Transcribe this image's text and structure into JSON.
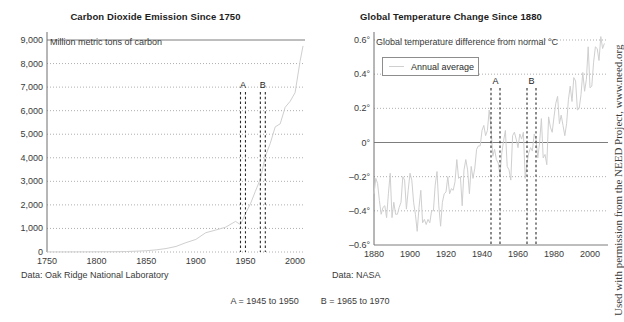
{
  "figure": {
    "side_note": "Used with permission from the NEED Project, www.need.org",
    "band_caption_a": "A  =  1945 to 1950",
    "band_caption_b": "B  =  1965 to 1970"
  },
  "chart_data": [
    {
      "type": "line",
      "id": "co2",
      "title": "Carbon Dioxide Emission Since 1750",
      "axis_note": "Million metric tons of carbon",
      "source": "Data: Oak Ridge National Laboratory",
      "xlabel": "",
      "ylabel": "Million metric tons of carbon",
      "xlim": [
        1750,
        2010
      ],
      "ylim": [
        0,
        9000
      ],
      "grid": true,
      "legend": "",
      "yticks": [
        "0",
        "1,000",
        "2,000",
        "3,000",
        "4,000",
        "5,000",
        "6,000",
        "7,000",
        "8,000",
        "9,000"
      ],
      "ytick_values": [
        0,
        1000,
        2000,
        3000,
        4000,
        5000,
        6000,
        7000,
        8000,
        9000
      ],
      "xticks": [
        "1750",
        "1800",
        "1850",
        "1900",
        "1950",
        "2000"
      ],
      "xtick_values": [
        1750,
        1800,
        1850,
        1900,
        1950,
        2000
      ],
      "annotations": [
        {
          "label": "A",
          "x_start": 1945,
          "x_end": 1950
        },
        {
          "label": "B",
          "x_start": 1965,
          "x_end": 1970
        }
      ],
      "series": [
        {
          "name": "Carbon dioxide emission",
          "x": [
            1750,
            1760,
            1770,
            1780,
            1790,
            1800,
            1810,
            1820,
            1830,
            1840,
            1850,
            1860,
            1870,
            1880,
            1890,
            1900,
            1910,
            1920,
            1930,
            1940,
            1945,
            1950,
            1955,
            1960,
            1965,
            1970,
            1975,
            1980,
            1985,
            1990,
            1995,
            2000,
            2005,
            2008
          ],
          "values": [
            3,
            3,
            4,
            5,
            6,
            8,
            10,
            12,
            20,
            35,
            54,
            91,
            147,
            236,
            396,
            534,
            819,
            932,
            1053,
            1299,
            1160,
            1630,
            2043,
            2577,
            3095,
            4053,
            4615,
            5313,
            5441,
            6143,
            6395,
            6765,
            8089,
            8749
          ]
        }
      ]
    },
    {
      "type": "line",
      "id": "temperature",
      "title": "Global Temperature Change Since 1880",
      "axis_note": "Global temperature difference from normal °C",
      "source": "Data: NASA",
      "xlabel": "",
      "ylabel": "Global temperature difference from normal °C",
      "xlim": [
        1880,
        2010
      ],
      "ylim": [
        -0.6,
        0.6
      ],
      "grid": true,
      "legend": "Annual average",
      "legend_position": "upper-left",
      "yticks": [
        "0.6°",
        "0.4°",
        "0.2°",
        "0°",
        "–0.2°",
        "–0.4°",
        "–0.6°"
      ],
      "ytick_values": [
        0.6,
        0.4,
        0.2,
        0,
        -0.2,
        -0.4,
        -0.6
      ],
      "xticks": [
        "1880",
        "1900",
        "1920",
        "1940",
        "1960",
        "1980",
        "2000"
      ],
      "xtick_values": [
        1880,
        1900,
        1920,
        1940,
        1960,
        1980,
        2000
      ],
      "annotations": [
        {
          "label": "A",
          "x_start": 1945,
          "x_end": 1950
        },
        {
          "label": "B",
          "x_start": 1965,
          "x_end": 1970
        }
      ],
      "series": [
        {
          "name": "Annual average",
          "x": [
            1880,
            1881,
            1882,
            1883,
            1884,
            1885,
            1886,
            1887,
            1888,
            1889,
            1890,
            1891,
            1892,
            1893,
            1894,
            1895,
            1896,
            1897,
            1898,
            1899,
            1900,
            1901,
            1902,
            1903,
            1904,
            1905,
            1906,
            1907,
            1908,
            1909,
            1910,
            1911,
            1912,
            1913,
            1914,
            1915,
            1916,
            1917,
            1918,
            1919,
            1920,
            1921,
            1922,
            1923,
            1924,
            1925,
            1926,
            1927,
            1928,
            1929,
            1930,
            1931,
            1932,
            1933,
            1934,
            1935,
            1936,
            1937,
            1938,
            1939,
            1940,
            1941,
            1942,
            1943,
            1944,
            1945,
            1946,
            1947,
            1948,
            1949,
            1950,
            1951,
            1952,
            1953,
            1954,
            1955,
            1956,
            1957,
            1958,
            1959,
            1960,
            1961,
            1962,
            1963,
            1964,
            1965,
            1966,
            1967,
            1968,
            1969,
            1970,
            1971,
            1972,
            1973,
            1974,
            1975,
            1976,
            1977,
            1978,
            1979,
            1980,
            1981,
            1982,
            1983,
            1984,
            1985,
            1986,
            1987,
            1988,
            1989,
            1990,
            1991,
            1992,
            1993,
            1994,
            1995,
            1996,
            1997,
            1998,
            1999,
            2000,
            2001,
            2002,
            2003,
            2004,
            2005,
            2006,
            2007,
            2008
          ],
          "values": [
            -0.3,
            -0.21,
            -0.24,
            -0.34,
            -0.42,
            -0.38,
            -0.37,
            -0.44,
            -0.3,
            -0.18,
            -0.44,
            -0.35,
            -0.42,
            -0.42,
            -0.38,
            -0.35,
            -0.2,
            -0.22,
            -0.39,
            -0.28,
            -0.18,
            -0.22,
            -0.35,
            -0.42,
            -0.52,
            -0.38,
            -0.28,
            -0.47,
            -0.45,
            -0.48,
            -0.45,
            -0.47,
            -0.4,
            -0.4,
            -0.25,
            -0.17,
            -0.37,
            -0.49,
            -0.35,
            -0.3,
            -0.29,
            -0.2,
            -0.3,
            -0.27,
            -0.28,
            -0.23,
            -0.1,
            -0.21,
            -0.2,
            -0.37,
            -0.16,
            -0.1,
            -0.16,
            -0.3,
            -0.14,
            -0.21,
            -0.15,
            -0.04,
            -0.02,
            -0.02,
            0.07,
            0.1,
            0.04,
            0.07,
            0.19,
            0.09,
            -0.08,
            -0.04,
            -0.1,
            -0.12,
            -0.19,
            -0.06,
            0.01,
            0.07,
            -0.14,
            -0.16,
            -0.22,
            0.04,
            0.06,
            0.02,
            -0.03,
            0.05,
            0.02,
            0.06,
            -0.21,
            -0.12,
            -0.06,
            -0.03,
            -0.05,
            0.05,
            0.02,
            -0.09,
            0.0,
            0.14,
            -0.09,
            -0.07,
            -0.13,
            0.15,
            0.09,
            0.06,
            0.15,
            0.23,
            0.27,
            0.11,
            0.16,
            0.1,
            0.04,
            0.11,
            0.25,
            0.33,
            0.24,
            0.38,
            0.36,
            0.19,
            0.2,
            0.28,
            0.41,
            0.3,
            0.37,
            0.56,
            0.32,
            0.33,
            0.47,
            0.56,
            0.55,
            0.48,
            0.62,
            0.55,
            0.58,
            0.43
          ]
        }
      ]
    }
  ]
}
